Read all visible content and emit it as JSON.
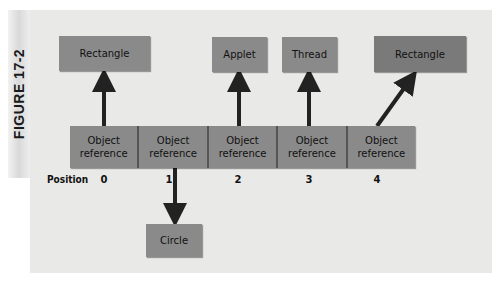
{
  "figure": {
    "label": "FIGURE 17-2",
    "colors": {
      "panel_bg": "#e9e9e7",
      "box_fill": "#8a8a8a",
      "arrow": "#222222"
    }
  },
  "targets": {
    "top": [
      {
        "label": "Rectangle",
        "from_index": 0
      },
      {
        "label": "Applet",
        "from_index": 2
      },
      {
        "label": "Thread",
        "from_index": 3
      },
      {
        "label": "Rectangle",
        "from_index": 4
      }
    ],
    "bottom": [
      {
        "label": "Circle",
        "from_index": 1
      }
    ]
  },
  "array": {
    "cells": [
      {
        "line1": "Object",
        "line2": "reference"
      },
      {
        "line1": "Object",
        "line2": "reference"
      },
      {
        "line1": "Object",
        "line2": "reference"
      },
      {
        "line1": "Object",
        "line2": "reference"
      },
      {
        "line1": "Object",
        "line2": "reference"
      }
    ],
    "position_label": "Position",
    "positions": [
      "0",
      "1",
      "2",
      "3",
      "4"
    ]
  }
}
